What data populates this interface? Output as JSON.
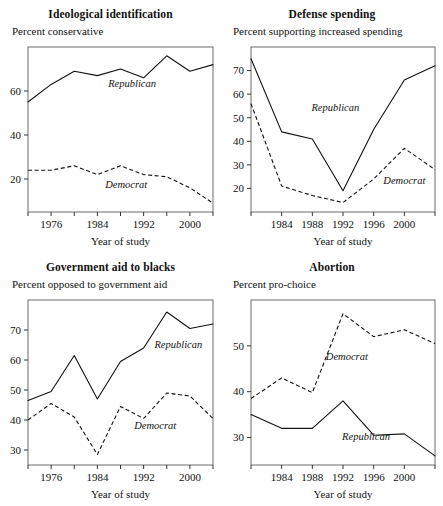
{
  "figure": {
    "panel_count": 4,
    "shared_xlabel": "Year of study",
    "republican_label": "Republican",
    "democrat_label": "Democrat",
    "line_color": "#111111",
    "frame_color": "#6b6b6b"
  },
  "chart_data": [
    {
      "type": "line",
      "title": "Ideological identification",
      "subtitle": "Percent conservative",
      "ylabel": "Percent conservative",
      "xlabel": "Year of study",
      "grid": false,
      "legend_position": "inline-annotation",
      "xlim": [
        1972,
        2004
      ],
      "ylim": [
        5,
        80
      ],
      "yticks": [
        20,
        40,
        60
      ],
      "ytick_labels": [
        "20",
        "40",
        "60"
      ],
      "xticks": [
        1976,
        1984,
        1992,
        2000
      ],
      "xtick_labels": [
        "1976",
        "1984",
        "1992",
        "2000"
      ],
      "xticks_minor": [
        1972,
        1980,
        1988,
        1996,
        2004
      ],
      "x": [
        1972,
        1976,
        1980,
        1984,
        1988,
        1992,
        1996,
        2000,
        2004
      ],
      "series": [
        {
          "name": "Republican",
          "style": "solid",
          "values": [
            55,
            63,
            69,
            67,
            70,
            66,
            76,
            69,
            72
          ]
        },
        {
          "name": "Democrat",
          "style": "dashed",
          "values": [
            24,
            24,
            26,
            22,
            26,
            22,
            21,
            16,
            9
          ]
        }
      ]
    },
    {
      "type": "line",
      "title": "Defense spending",
      "subtitle": "Percent supporting increased spending",
      "ylabel": "Percent supporting increased spending",
      "xlabel": "Year of study",
      "grid": false,
      "legend_position": "inline-annotation",
      "xlim": [
        1980,
        2004
      ],
      "ylim": [
        10,
        80
      ],
      "yticks": [
        20,
        30,
        40,
        50,
        60,
        70
      ],
      "ytick_labels": [
        "20",
        "30",
        "40",
        "50",
        "60",
        "70"
      ],
      "xticks": [
        1984,
        1988,
        1992,
        1996,
        2000
      ],
      "xtick_labels": [
        "1984",
        "1988",
        "1992",
        "1996",
        "2000"
      ],
      "xticks_minor": [
        1980,
        2004
      ],
      "x": [
        1980,
        1984,
        1988,
        1992,
        1996,
        2000,
        2004
      ],
      "series": [
        {
          "name": "Republican",
          "style": "solid",
          "values": [
            75,
            44,
            41,
            19,
            45,
            66,
            72
          ]
        },
        {
          "name": "Democrat",
          "style": "dashed",
          "values": [
            56,
            21,
            17,
            14,
            24,
            37,
            28
          ]
        }
      ]
    },
    {
      "type": "line",
      "title": "Government aid to blacks",
      "subtitle": "Percent opposed to government aid",
      "ylabel": "Percent opposed to government aid",
      "xlabel": "Year of study",
      "grid": false,
      "legend_position": "inline-annotation",
      "xlim": [
        1972,
        2004
      ],
      "ylim": [
        25,
        80
      ],
      "yticks": [
        30,
        40,
        50,
        60,
        70
      ],
      "ytick_labels": [
        "30",
        "40",
        "50",
        "60",
        "70"
      ],
      "xticks": [
        1976,
        1984,
        1992,
        2000
      ],
      "xtick_labels": [
        "1976",
        "1984",
        "1992",
        "2000"
      ],
      "xticks_minor": [
        1972,
        1980,
        1988,
        1996,
        2004
      ],
      "x": [
        1972,
        1976,
        1980,
        1984,
        1988,
        1992,
        1996,
        2000,
        2004
      ],
      "series": [
        {
          "name": "Republican",
          "style": "solid",
          "values": [
            46.5,
            49.5,
            61.5,
            47,
            59.5,
            64,
            76,
            70.5,
            72
          ]
        },
        {
          "name": "Democrat",
          "style": "dashed",
          "values": [
            40,
            45.5,
            41,
            28.5,
            44.5,
            40.5,
            49,
            48,
            40.5
          ]
        }
      ]
    },
    {
      "type": "line",
      "title": "Abortion",
      "subtitle": "Percent pro-choice",
      "ylabel": "Percent pro-choice",
      "xlabel": "Year of study",
      "grid": false,
      "legend_position": "inline-annotation",
      "xlim": [
        1980,
        2004
      ],
      "ylim": [
        24,
        60
      ],
      "yticks": [
        30,
        40,
        50
      ],
      "ytick_labels": [
        "30",
        "40",
        "50"
      ],
      "xticks": [
        1984,
        1988,
        1992,
        1996,
        2000
      ],
      "xtick_labels": [
        "1984",
        "1988",
        "1992",
        "1996",
        "2000"
      ],
      "xticks_minor": [
        1980,
        2004
      ],
      "x": [
        1980,
        1984,
        1988,
        1992,
        1996,
        2000,
        2004
      ],
      "series": [
        {
          "name": "Republican",
          "style": "solid",
          "values": [
            35,
            32,
            32,
            38,
            30.5,
            30.8,
            26
          ]
        },
        {
          "name": "Democrat",
          "style": "dashed",
          "values": [
            38.5,
            43,
            39.8,
            57,
            52,
            53.5,
            50.5
          ]
        }
      ]
    }
  ],
  "annotations": {
    "panel0": {
      "republican": {
        "x": 1990,
        "y": 62
      },
      "democrat": {
        "x": 1989,
        "y": 16
      }
    },
    "panel1": {
      "republican": {
        "x": 1991,
        "y": 53
      },
      "democrat": {
        "x": 2000,
        "y": 22
      }
    },
    "panel2": {
      "republican": {
        "x": 1998,
        "y": 64
      },
      "democrat": {
        "x": 1994,
        "y": 37
      }
    },
    "panel3": {
      "republican": {
        "x": 1995,
        "y": 29.5
      },
      "democrat": {
        "x": 1992.5,
        "y": 47
      }
    }
  }
}
